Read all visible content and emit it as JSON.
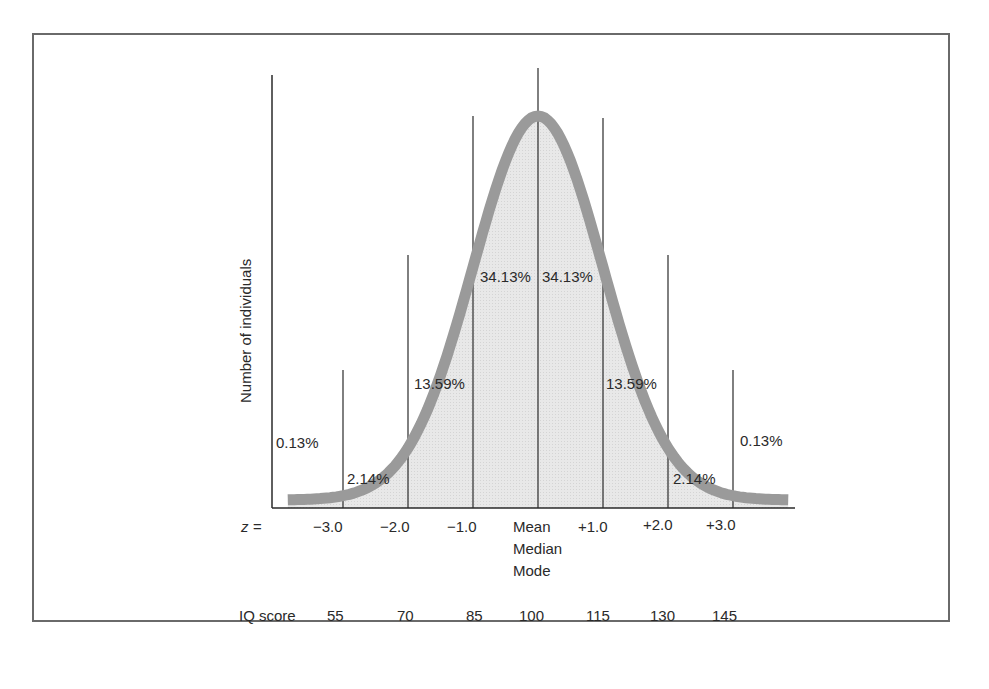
{
  "chart_data": {
    "type": "area",
    "title": "",
    "xlabel": "z =",
    "ylabel": "Number of individuals",
    "distribution": "normal",
    "mean": 100,
    "sd": 15,
    "z_ticks": [
      "−3.0",
      "−2.0",
      "−1.0",
      "Mean",
      "+1.0",
      "+2.0",
      "+3.0"
    ],
    "z_values": [
      -3,
      -2,
      -1,
      0,
      1,
      2,
      3
    ],
    "center_label_lines": [
      "Mean",
      "Median",
      "Mode"
    ],
    "iq_label": "IQ score",
    "iq_ticks": [
      "55",
      "70",
      "85",
      "100",
      "115",
      "130",
      "145"
    ],
    "regions": [
      {
        "range": "below -3",
        "label": "0.13%",
        "value": 0.13
      },
      {
        "range": "-3 to -2",
        "label": "2.14%",
        "value": 2.14
      },
      {
        "range": "-2 to -1",
        "label": "13.59%",
        "value": 13.59
      },
      {
        "range": "-1 to 0",
        "label": "34.13%",
        "value": 34.13
      },
      {
        "range": "0 to +1",
        "label": "34.13%",
        "value": 34.13
      },
      {
        "range": "+1 to +2",
        "label": "13.59%",
        "value": 13.59
      },
      {
        "range": "+2 to +3",
        "label": "2.14%",
        "value": 2.14
      },
      {
        "range": "above +3",
        "label": "0.13%",
        "value": 0.13
      }
    ],
    "colors": {
      "curve": "#9a9a9a",
      "fill": "#e6e6e6",
      "lines": "#2a2a2a",
      "frame": "#6a6a6a"
    }
  }
}
